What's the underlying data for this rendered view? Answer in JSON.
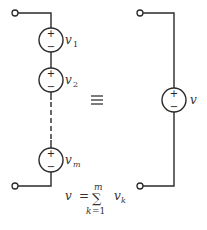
{
  "diagram": {
    "left_circuit": {
      "sources": [
        {
          "symbol": "v",
          "subscript": "1",
          "plus": "+",
          "minus": "−"
        },
        {
          "symbol": "v",
          "subscript": "2",
          "plus": "+",
          "minus": "−"
        },
        {
          "symbol": "v",
          "subscript": "m",
          "plus": "+",
          "minus": "−"
        }
      ]
    },
    "equivalence_symbol": "≡",
    "right_circuit": {
      "source": {
        "symbol": "v",
        "plus": "+",
        "minus": "−"
      }
    },
    "formula": {
      "lhs": "v",
      "equals": "=",
      "sum": "∑",
      "upper_limit": "m",
      "lower_index": "k",
      "lower_equals": "=1",
      "term": "v",
      "term_subscript": "k"
    }
  }
}
